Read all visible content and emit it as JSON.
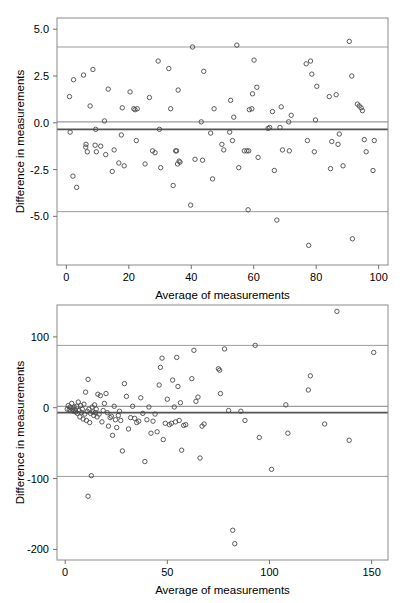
{
  "figure": {
    "name": "bland-altman-figure",
    "panels": 2,
    "background": "#ffffff",
    "point_color": "#4a4a4a",
    "reference_line_color": "#9a9a9a",
    "bias_line_color": "#545454"
  },
  "chart_data": [
    {
      "id": "top",
      "type": "scatter",
      "title": "",
      "xlabel": "Average of  measurements",
      "ylabel": "Difference in measurements",
      "xlim": [
        -3,
        103
      ],
      "ylim": [
        -7.6,
        5.6
      ],
      "xticks": [
        0,
        20,
        40,
        60,
        80,
        100
      ],
      "xticklabels": [
        "0",
        "20",
        "40",
        "60",
        "80",
        "100"
      ],
      "yticks": [
        5.0,
        2.5,
        0.0,
        -2.5,
        -5.0
      ],
      "yticklabels": [
        "5.0",
        "2.5",
        "0.0",
        "-2.5",
        "-5.0"
      ],
      "grid": false,
      "legend": "none",
      "reference_lines": [
        {
          "name": "upper-limit-of-agreement",
          "y": 4.05,
          "style": "light"
        },
        {
          "name": "zero-line",
          "y": 0.05,
          "style": "light"
        },
        {
          "name": "mean-bias",
          "y": -0.35,
          "style": "dark"
        },
        {
          "name": "lower-limit-of-agreement",
          "y": -4.75,
          "style": "light"
        }
      ],
      "x": [
        1.0,
        1.2,
        2.3,
        2.1,
        3.3,
        5.5,
        6.2,
        6.3,
        6.7,
        7.6,
        8.5,
        9.2,
        9.4,
        9.6,
        11.0,
        12.2,
        12.6,
        13.4,
        14.7,
        15.3,
        16.8,
        17.6,
        17.9,
        18.5,
        20.4,
        21.6,
        22.0,
        22.4,
        22.7,
        25.2,
        26.6,
        27.6,
        28.4,
        29.4,
        29.8,
        30.2,
        32.8,
        33.4,
        34.2,
        35.0,
        35.3,
        35.6,
        35.8,
        36.1,
        36.4,
        39.8,
        40.4,
        41.2,
        43.2,
        43.6,
        44.0,
        46.2,
        46.8,
        47.3,
        49.8,
        50.4,
        52.3,
        52.6,
        53.2,
        53.6,
        54.6,
        55.2,
        57.0,
        57.8,
        58.2,
        58.4,
        58.6,
        59.4,
        59.6,
        60.1,
        61.0,
        61.4,
        64.6,
        65.1,
        66.0,
        66.6,
        67.4,
        68.4,
        68.8,
        69.2,
        71.2,
        71.4,
        72.0,
        76.8,
        77.2,
        77.6,
        78.2,
        78.6,
        79.4,
        79.8,
        80.2,
        84.2,
        84.6,
        85.0,
        86.4,
        87.0,
        87.4,
        88.6,
        90.6,
        91.4,
        91.6,
        93.2,
        93.8,
        94.4,
        94.8,
        95.4,
        96.0,
        98.2,
        98.6
      ],
      "y": [
        1.4,
        -0.5,
        2.3,
        -2.85,
        -3.45,
        2.55,
        -1.3,
        -1.15,
        -1.55,
        0.9,
        2.85,
        -1.2,
        -0.35,
        -1.55,
        -1.25,
        0.1,
        -1.7,
        1.8,
        -2.6,
        -1.45,
        -2.15,
        -0.65,
        0.8,
        -2.3,
        1.65,
        0.75,
        0.7,
        -0.95,
        0.75,
        -2.2,
        1.35,
        -1.5,
        -1.6,
        3.3,
        -0.35,
        -2.4,
        2.9,
        0.75,
        -3.35,
        -1.5,
        -1.5,
        -2.2,
        1.75,
        -2.05,
        -2.1,
        -4.4,
        4.05,
        -1.95,
        0.05,
        -2.0,
        2.75,
        -0.55,
        -3.0,
        0.75,
        -1.15,
        -1.45,
        -0.5,
        1.2,
        -0.95,
        0.3,
        4.15,
        -2.4,
        -1.5,
        -1.5,
        -4.65,
        -1.5,
        0.7,
        0.75,
        1.55,
        3.35,
        1.9,
        -1.85,
        -0.3,
        -0.25,
        0.6,
        -2.55,
        -5.2,
        -0.25,
        0.85,
        -1.45,
        0.05,
        -1.5,
        0.4,
        3.15,
        -0.95,
        -6.55,
        3.3,
        2.6,
        -1.55,
        0.15,
        1.95,
        1.4,
        -2.45,
        -1.0,
        1.5,
        -1.15,
        -0.6,
        -2.3,
        4.35,
        2.5,
        -6.2,
        1.0,
        0.9,
        0.8,
        0.65,
        -0.9,
        -1.55,
        -2.55,
        -0.95
      ]
    },
    {
      "id": "bottom",
      "type": "scatter",
      "title": "",
      "xlabel": "Average of  measurements",
      "ylabel": "Difference in measurements",
      "xlim": [
        -4,
        158
      ],
      "ylim": [
        -215,
        145
      ],
      "xticks": [
        0,
        50,
        100,
        150
      ],
      "xticklabels": [
        "0",
        "50",
        "100",
        "150"
      ],
      "yticks": [
        100,
        0,
        -100,
        -200
      ],
      "yticklabels": [
        "100",
        "0",
        "-100",
        "-200"
      ],
      "grid": false,
      "legend": "none",
      "reference_lines": [
        {
          "name": "upper-limit-of-agreement",
          "y": 88,
          "style": "light"
        },
        {
          "name": "zero-line",
          "y": 2,
          "style": "light"
        },
        {
          "name": "mean-bias",
          "y": -7,
          "style": "dark"
        },
        {
          "name": "lower-limit-of-agreement",
          "y": -97,
          "style": "light"
        }
      ],
      "x": [
        1.0,
        1.5,
        2.0,
        2.4,
        2.8,
        3.2,
        3.6,
        4.0,
        4.4,
        4.8,
        5.2,
        5.6,
        6.0,
        6.4,
        6.8,
        7.2,
        7.6,
        8.0,
        8.4,
        8.8,
        9.2,
        9.6,
        10.0,
        10.4,
        10.8,
        11.2,
        11.6,
        11.2,
        12.0,
        12.4,
        12.8,
        13.2,
        13.6,
        14.0,
        14.4,
        14.8,
        15.2,
        15.6,
        16.0,
        16.6,
        17.2,
        18.0,
        18.6,
        19.2,
        20.0,
        20.6,
        21.2,
        22.0,
        22.6,
        23.2,
        24.0,
        24.6,
        25.2,
        26.0,
        26.6,
        27.2,
        28.0,
        29.0,
        30.0,
        31.0,
        32.0,
        33.0,
        34.0,
        35.0,
        36.0,
        37.0,
        38.0,
        39.0,
        40.0,
        41.0,
        42.0,
        43.0,
        44.0,
        45.0,
        46.0,
        46.6,
        47.4,
        48.0,
        49.0,
        50.0,
        51.0,
        52.0,
        52.6,
        53.4,
        54.0,
        54.6,
        55.2,
        55.8,
        56.4,
        57.0,
        58.0,
        59.0,
        62.0,
        63.0,
        64.0,
        65.0,
        66.0,
        67.0,
        68.0,
        75.0,
        75.6,
        76.0,
        78.0,
        80.0,
        82.0,
        83.0,
        86.0,
        88.0,
        93.0,
        95.0,
        101.0,
        108.0,
        109.0,
        119.0,
        120.0,
        127.0,
        133.0,
        139.0,
        151.0
      ],
      "y": [
        -2,
        3,
        -3,
        1,
        -4,
        6,
        -2,
        -5,
        1,
        -3,
        -6,
        2,
        -8,
        8,
        -4,
        -13,
        3,
        -7,
        -2,
        -16,
        5,
        -9,
        22,
        -18,
        -5,
        40,
        -2,
        -125,
        -21,
        -8,
        -96,
        1,
        -6,
        -11,
        4,
        -7,
        -2,
        -13,
        19,
        -9,
        17,
        -20,
        -4,
        6,
        20,
        -7,
        -26,
        -14,
        -12,
        -39,
        2,
        -17,
        -28,
        -11,
        -5,
        -18,
        -61,
        34,
        16,
        -30,
        -14,
        2,
        -15,
        -21,
        -19,
        14,
        -8,
        -76,
        -17,
        1,
        -36,
        -19,
        -9,
        -34,
        32,
        57,
        70,
        -45,
        -22,
        12,
        -24,
        -22,
        39,
        1,
        -20,
        71,
        30,
        -18,
        7,
        -60,
        -25,
        -24,
        41,
        81,
        9,
        15,
        -71,
        -26,
        -23,
        55,
        53,
        20,
        83,
        -4,
        -173,
        -192,
        -5,
        -18,
        88,
        -42,
        -87,
        4,
        -36,
        25,
        45,
        -23,
        136,
        -46,
        78
      ]
    }
  ]
}
